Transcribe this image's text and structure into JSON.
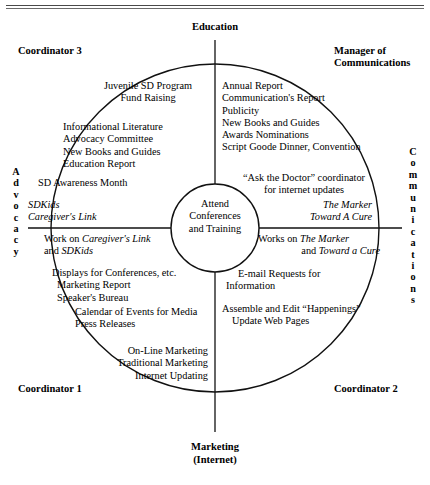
{
  "diagram": {
    "title_rule": "double-rule",
    "axes": {
      "top_label": "Education",
      "bottom_label_line1": "Marketing",
      "bottom_label_line2": "(Internet)",
      "left_label": "Advocacy",
      "right_label": "Communications"
    },
    "corners": {
      "top_left": "Coordinator 3",
      "top_right_line1": "Manager of",
      "top_right_line2": "Communications",
      "bottom_left": "Coordinator 1",
      "bottom_right": "Coordinator 2"
    },
    "center": {
      "line1": "Attend",
      "line2": "Conferences",
      "line3": "and Training"
    },
    "quadrants": {
      "top_left": {
        "group1": [
          "Juvenile SD Program",
          "Fund Raising"
        ],
        "group2": [
          "Informational Literature",
          "Advocacy Committee",
          "New Books and Guides",
          "Education Report"
        ],
        "group3": [
          "SD Awareness Month"
        ],
        "group4_italic": [
          "SDKids",
          "Caregiver's Link"
        ]
      },
      "top_right": {
        "group1": [
          "Annual Report",
          "Communication's Report",
          "Publicity",
          "New Books and Guides",
          "Awards Nominations",
          "Script Goode Dinner, Convention"
        ],
        "group2": [
          "“Ask the Doctor” coordinator",
          "for internet updates"
        ],
        "group3_italic": [
          "The Marker",
          "Toward A Cure"
        ]
      },
      "bottom_left": {
        "group1_line1_pre": "Work on ",
        "group1_line1_italic": "Caregiver's Link",
        "group1_line2_pre": "and ",
        "group1_line2_italic": "SDKids",
        "group2": [
          "Displays for Conferences, etc.",
          "Marketing Report",
          "Speaker's Bureau"
        ],
        "group3": [
          "Calendar of Events for Media",
          "Press Releases"
        ],
        "group4": [
          "On-Line Marketing",
          "Traditional Marketing",
          "Internet Updating"
        ]
      },
      "bottom_right": {
        "group1_line1_pre": "Works on ",
        "group1_line1_italic": "The Marker",
        "group1_line2_pre": "and ",
        "group1_line2_italic": "Toward a Cure",
        "group2": [
          "E-mail Requests for",
          "Information"
        ],
        "group3": [
          "Assemble and Edit “Happenings”",
          "Update Web Pages"
        ]
      }
    },
    "colors": {
      "stroke": "#111111",
      "rule": "#4a4a4a",
      "background": "#ffffff"
    }
  }
}
